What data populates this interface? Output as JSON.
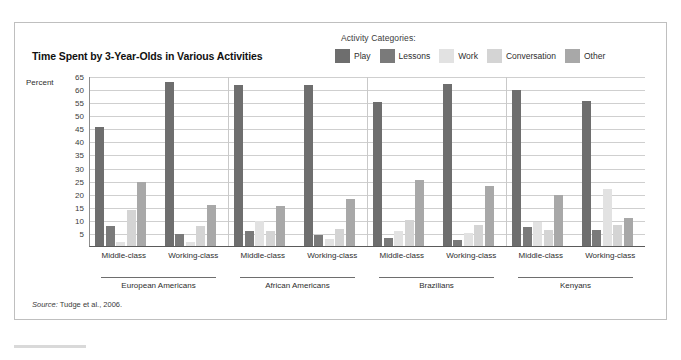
{
  "title": "Time Spent by 3-Year-Olds in Various Activities",
  "legend": {
    "title": "Activity Categories:",
    "items": [
      {
        "label": "Play",
        "color": "#6e6e6e"
      },
      {
        "label": "Lessons",
        "color": "#7a7a7a"
      },
      {
        "label": "Work",
        "color": "#e2e2e2"
      },
      {
        "label": "Conversation",
        "color": "#d4d4d4"
      },
      {
        "label": "Other",
        "color": "#a8a8a8"
      }
    ]
  },
  "axis": {
    "y_title": "Percent",
    "ticks": [
      "65",
      "60",
      "55",
      "50",
      "45",
      "40",
      "35",
      "30",
      "25",
      "20",
      "15",
      "10",
      "5"
    ]
  },
  "source": {
    "prefix": "Source:",
    "text": " Tudge et al., 2006."
  },
  "chart_data": {
    "type": "bar",
    "title": "Time Spent by 3-Year-Olds in Various Activities",
    "xlabel": "",
    "ylabel": "Percent",
    "ylim": [
      0,
      65
    ],
    "grid": true,
    "legend_position": "top-right",
    "categories": [
      "European Americans – Middle-class",
      "European Americans – Working-class",
      "African Americans – Middle-class",
      "African Americans – Working-class",
      "Brazilians – Middle-class",
      "Brazilians – Working-class",
      "Kenyans – Middle-class",
      "Kenyans – Working-class"
    ],
    "groups": [
      {
        "name": "European Americans",
        "classes": [
          "Middle-class",
          "Working-class"
        ]
      },
      {
        "name": "African Americans",
        "classes": [
          "Middle-class",
          "Working-class"
        ]
      },
      {
        "name": "Brazilians",
        "classes": [
          "Middle-class",
          "Working-class"
        ]
      },
      {
        "name": "Kenyans",
        "classes": [
          "Middle-class",
          "Working-class"
        ]
      }
    ],
    "series": [
      {
        "name": "Play",
        "color": "#6e6e6e",
        "values": [
          46,
          63,
          62,
          62,
          55.5,
          62.5,
          60,
          56
        ]
      },
      {
        "name": "Lessons",
        "color": "#7a7a7a",
        "values": [
          8,
          5,
          6,
          4.5,
          3.5,
          2.5,
          7.5,
          6.5
        ]
      },
      {
        "name": "Work",
        "color": "#e2e2e2",
        "values": [
          2,
          2,
          10,
          3,
          6,
          5.5,
          9.5,
          22
        ]
      },
      {
        "name": "Conversation",
        "color": "#d4d4d4",
        "values": [
          14,
          8,
          6,
          7,
          10.5,
          8.5,
          6.5,
          8.5
        ]
      },
      {
        "name": "Other",
        "color": "#a8a8a8",
        "values": [
          25,
          16,
          15.5,
          18.5,
          25.5,
          23.5,
          20,
          11
        ]
      }
    ]
  }
}
